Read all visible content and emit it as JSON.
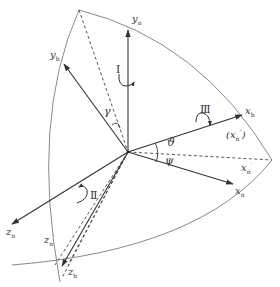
{
  "diagram": {
    "type": "coordinate-frame-rotation",
    "colors": {
      "axis": "#333333",
      "arc": "#888888",
      "dashed": "#444444",
      "background": "#ffffff"
    },
    "axes": {
      "yn": {
        "base": "y",
        "sub": "n",
        "sup": ""
      },
      "yb": {
        "base": "y",
        "sub": "b",
        "sup": ""
      },
      "xb": {
        "base": "x",
        "sub": "b",
        "sup": ""
      },
      "xn_double_prime": {
        "open": "(",
        "base": "x",
        "sub": "n",
        "sup": "″",
        "close": ")"
      },
      "xn_prime": {
        "base": "x",
        "sub": "n",
        "sup": "′"
      },
      "xn": {
        "base": "x",
        "sub": "n",
        "sup": ""
      },
      "zn": {
        "base": "z",
        "sub": "n",
        "sup": ""
      },
      "zn_prime": {
        "base": "z",
        "sub": "n",
        "sup": "′"
      },
      "zb": {
        "base": "z",
        "sub": "b",
        "sup": ""
      }
    },
    "rotations": {
      "first": "Ⅰ",
      "second": "Ⅱ",
      "third": "Ⅲ"
    },
    "angles": {
      "gamma": "γ",
      "theta": "ϑ",
      "psi": "ψ"
    }
  }
}
